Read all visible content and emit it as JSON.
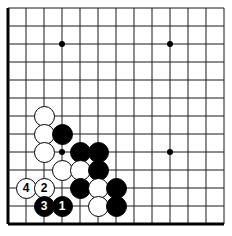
{
  "figure": {
    "board_size_cols": 13,
    "board_size_rows": 13,
    "origin_x": 8,
    "origin_y": 8,
    "spacing": 18,
    "background_color": "#ffffff",
    "line_color": "#1a1a1a",
    "border_color": "#000000",
    "black_color": "#000000",
    "white_color": "#ffffff"
  },
  "star_points": [
    {
      "name": "star-point-upper-left",
      "col": 3,
      "row": 2
    },
    {
      "name": "star-point-upper-right",
      "col": 9,
      "row": 2
    },
    {
      "name": "star-point-lower-left",
      "col": 3,
      "row": 8
    },
    {
      "name": "star-point-lower-right",
      "col": 9,
      "row": 8
    }
  ],
  "stones": [
    {
      "name": "white-stone-c2-r6",
      "color": "white",
      "col": 2,
      "row": 6,
      "label": ""
    },
    {
      "name": "white-stone-c2-r7",
      "color": "white",
      "col": 2,
      "row": 7,
      "label": ""
    },
    {
      "name": "white-stone-c2-r8",
      "color": "white",
      "col": 2,
      "row": 8,
      "label": ""
    },
    {
      "name": "black-stone-c3-r7",
      "color": "black",
      "col": 3,
      "row": 7,
      "label": ""
    },
    {
      "name": "black-stone-c4-r8",
      "color": "black",
      "col": 4,
      "row": 8,
      "label": ""
    },
    {
      "name": "black-stone-c5-r8",
      "color": "black",
      "col": 5,
      "row": 8,
      "label": ""
    },
    {
      "name": "white-stone-c3-r9",
      "color": "white",
      "col": 3,
      "row": 9,
      "label": ""
    },
    {
      "name": "white-stone-c4-r9",
      "color": "white",
      "col": 4,
      "row": 9,
      "label": ""
    },
    {
      "name": "black-stone-c5-r9",
      "color": "black",
      "col": 5,
      "row": 9,
      "label": ""
    },
    {
      "name": "black-stone-c4-r10",
      "color": "black",
      "col": 4,
      "row": 10,
      "label": ""
    },
    {
      "name": "white-stone-c5-r10",
      "color": "white",
      "col": 5,
      "row": 10,
      "label": ""
    },
    {
      "name": "black-stone-c6-r10",
      "color": "black",
      "col": 6,
      "row": 10,
      "label": ""
    },
    {
      "name": "white-stone-c5-r11",
      "color": "white",
      "col": 5,
      "row": 11,
      "label": ""
    },
    {
      "name": "black-stone-c6-r11",
      "color": "black",
      "col": 6,
      "row": 11,
      "label": ""
    },
    {
      "name": "move-4-white-stone",
      "color": "white",
      "col": 1,
      "row": 10,
      "label": "4"
    },
    {
      "name": "move-2-white-stone",
      "color": "white",
      "col": 2,
      "row": 10,
      "label": "2"
    },
    {
      "name": "move-3-black-stone",
      "color": "black",
      "col": 2,
      "row": 11,
      "label": "3"
    },
    {
      "name": "move-1-black-stone",
      "color": "black",
      "col": 3,
      "row": 11,
      "label": "1"
    }
  ]
}
